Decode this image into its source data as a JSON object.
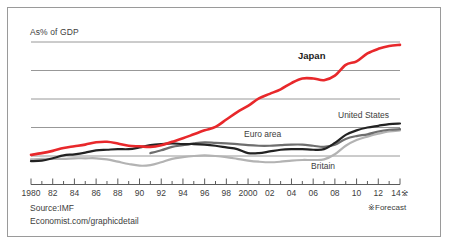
{
  "meta": {
    "y_axis_label": "As% of GDP",
    "source": "Source:IMF",
    "website": "Economist.com/graphicdetail",
    "forecast_note": "※Forecast",
    "forecast_marker": "※"
  },
  "colors": {
    "japan": "#e8282b",
    "united_states": "#222222",
    "euro_area": "#6e6e6e",
    "britain": "#b3b3b3",
    "gridline": "#8c8c8c",
    "axis": "#4a4a4a",
    "frame": "#9a9a9a",
    "text": "#3d3d3d",
    "background": "#ffffff"
  },
  "chart_data": {
    "type": "line",
    "title": "",
    "subtitle": "",
    "xlabel": "",
    "ylabel": "As% of GDP",
    "grid": true,
    "legend": "inline-labels",
    "xlim": [
      1980,
      2014
    ],
    "ylim": [
      0,
      250
    ],
    "ytick_values": [
      50,
      100,
      150,
      200,
      250
    ],
    "x": [
      1980,
      1981,
      1982,
      1983,
      1984,
      1985,
      1986,
      1987,
      1988,
      1989,
      1990,
      1991,
      1992,
      1993,
      1994,
      1995,
      1996,
      1997,
      1998,
      1999,
      2000,
      2001,
      2002,
      2003,
      2004,
      2005,
      2006,
      2007,
      2008,
      2009,
      2010,
      2011,
      2012,
      2013,
      2014
    ],
    "tick_labels": [
      "1980",
      "82",
      "84",
      "86",
      "88",
      "90",
      "92",
      "94",
      "96",
      "98",
      "2000",
      "02",
      "04",
      "06",
      "08",
      "10",
      "12",
      "14※"
    ],
    "tick_label_years": [
      1980,
      1982,
      1984,
      1986,
      1988,
      1990,
      1992,
      1994,
      1996,
      1998,
      2000,
      2002,
      2004,
      2006,
      2008,
      2010,
      2012,
      2014
    ],
    "series": [
      {
        "name": "Japan",
        "color": "#e8282b",
        "width": 2.6,
        "label_position": "above-line-2007",
        "values": [
          52,
          55,
          59,
          64,
          67,
          70,
          74,
          75,
          72,
          68,
          67,
          66,
          69,
          75,
          81,
          88,
          95,
          101,
          114,
          127,
          138,
          151,
          159,
          167,
          178,
          186,
          186,
          183,
          191,
          210,
          216,
          230,
          238,
          243,
          245
        ]
      },
      {
        "name": "United States",
        "color": "#222222",
        "width": 2.2,
        "label_position": "above-line-2012",
        "values": [
          41,
          42,
          46,
          51,
          53,
          56,
          60,
          61,
          62,
          62,
          65,
          69,
          71,
          72,
          71,
          71,
          70,
          68,
          65,
          62,
          55,
          55,
          58,
          61,
          62,
          62,
          61,
          62,
          73,
          87,
          95,
          100,
          103,
          106,
          107
        ]
      },
      {
        "name": "Euro area",
        "color": "#6e6e6e",
        "width": 2.2,
        "start_year": 1991,
        "label_position": "above-line-2000",
        "values": [
          null,
          null,
          null,
          null,
          null,
          null,
          null,
          null,
          null,
          null,
          null,
          55,
          60,
          66,
          69,
          72,
          74,
          73,
          72,
          71,
          69,
          68,
          68,
          69,
          70,
          70,
          68,
          66,
          70,
          80,
          85,
          88,
          93,
          96,
          97
        ]
      },
      {
        "name": "Britain",
        "color": "#b3b3b3",
        "width": 2.2,
        "label_position": "below-line-2008",
        "values": [
          44,
          45,
          45,
          45,
          46,
          46,
          46,
          44,
          40,
          36,
          33,
          34,
          39,
          45,
          48,
          50,
          51,
          50,
          48,
          45,
          42,
          40,
          39,
          40,
          42,
          43,
          43,
          44,
          53,
          68,
          78,
          84,
          89,
          93,
          95
        ]
      }
    ],
    "annotations": [
      {
        "text": "Japan",
        "series": "Japan",
        "bold": true
      },
      {
        "text": "United States",
        "series": "United States",
        "bold": false
      },
      {
        "text": "Euro area",
        "series": "Euro area",
        "bold": false
      },
      {
        "text": "Britain",
        "series": "Britain",
        "bold": false
      }
    ]
  }
}
